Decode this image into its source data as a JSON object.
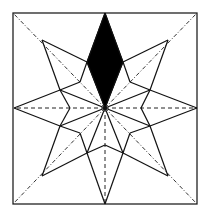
{
  "figure": {
    "frame": {
      "x": 13,
      "y": 13,
      "w": 184,
      "h": 191
    },
    "center": [
      105,
      108
    ],
    "tips": [
      [
        105,
        13
      ],
      [
        168,
        40
      ],
      [
        197,
        108
      ],
      [
        168,
        176
      ],
      [
        105,
        204
      ],
      [
        42,
        176
      ],
      [
        14,
        108
      ],
      [
        42,
        40
      ]
    ],
    "shoulders": [
      [
        123,
        62
      ],
      [
        150,
        90
      ],
      [
        150,
        126
      ],
      [
        123,
        153
      ],
      [
        87,
        153
      ],
      [
        60,
        126
      ],
      [
        60,
        90
      ],
      [
        87,
        62
      ]
    ],
    "inner_vertices": [
      [
        105,
        72
      ],
      [
        130,
        82
      ],
      [
        141,
        108
      ],
      [
        130,
        133
      ],
      [
        105,
        145
      ],
      [
        80,
        133
      ],
      [
        70,
        108
      ],
      [
        80,
        82
      ]
    ],
    "shaded_point_index": 0,
    "colors": {
      "line": "#111111",
      "fill": "#000000",
      "background": "#ffffff"
    }
  }
}
